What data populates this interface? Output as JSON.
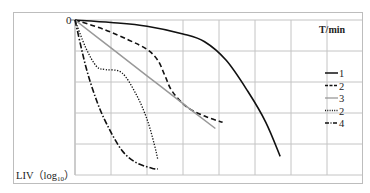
{
  "chart_data": {
    "type": "line",
    "title": "",
    "xlabel": "",
    "ylabel": "LIV (log10)",
    "ylabel_main": "LIV（log",
    "ylabel_sub": "10",
    "ylabel_close": "）",
    "y_origin_label": "0",
    "legend_title": "T/min",
    "legend_position": "right",
    "grid": true,
    "x_units": "relative grid units (0–7)",
    "y_units": "relative grid units (0 at top, 5 at bottom)",
    "xlim": [
      0,
      7
    ],
    "ylim": [
      5,
      0
    ],
    "series": [
      {
        "name": "1",
        "style": "solid",
        "color": "#111111",
        "points": [
          [
            0,
            0
          ],
          [
            1,
            0.08
          ],
          [
            2,
            0.2
          ],
          [
            3,
            0.45
          ],
          [
            3.6,
            0.7
          ],
          [
            4.2,
            1.3
          ],
          [
            4.8,
            2.3
          ],
          [
            5.3,
            3.3
          ],
          [
            5.7,
            4.4
          ]
        ]
      },
      {
        "name": "2",
        "style": "dashed",
        "color": "#111111",
        "points": [
          [
            0,
            0
          ],
          [
            0.8,
            0.3
          ],
          [
            1.5,
            0.65
          ],
          [
            2,
            0.95
          ],
          [
            2.3,
            1.3
          ],
          [
            2.5,
            1.8
          ],
          [
            2.7,
            2.3
          ],
          [
            3.1,
            2.8
          ],
          [
            3.6,
            3.1
          ],
          [
            4.1,
            3.3
          ]
        ]
      },
      {
        "name": "3",
        "style": "solid",
        "color": "#999999",
        "points": [
          [
            0,
            0
          ],
          [
            1,
            0.9
          ],
          [
            2,
            1.8
          ],
          [
            3,
            2.7
          ],
          [
            3.9,
            3.5
          ]
        ]
      },
      {
        "name": "2",
        "style": "dotted",
        "color": "#111111",
        "points": [
          [
            0,
            0
          ],
          [
            0.3,
            0.9
          ],
          [
            0.6,
            1.5
          ],
          [
            0.85,
            1.6
          ],
          [
            1.3,
            1.7
          ],
          [
            1.7,
            2.4
          ],
          [
            2,
            3.2
          ],
          [
            2.2,
            4.0
          ],
          [
            2.3,
            4.5
          ]
        ]
      },
      {
        "name": "4",
        "style": "dashdot",
        "color": "#111111",
        "points": [
          [
            0,
            0
          ],
          [
            0.3,
            1.5
          ],
          [
            0.6,
            2.6
          ],
          [
            0.9,
            3.4
          ],
          [
            1.3,
            4.2
          ],
          [
            1.7,
            4.6
          ],
          [
            2.2,
            4.8
          ],
          [
            2.3,
            4.8
          ]
        ]
      }
    ]
  }
}
